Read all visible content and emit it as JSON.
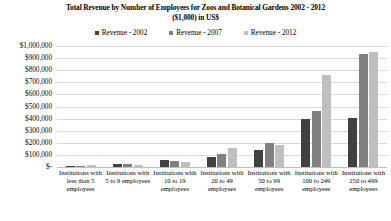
{
  "chart_data": {
    "type": "bar",
    "title": "Total Revenue by Number of Employees for Zoos and Botanical Gardens 2002 - 2012 ($1,000) in US$",
    "title_line1": "Total Revenue by Number of Employees for Zoos and Botanical Gardens 2002 - 2012",
    "title_line2": "($1,000) in US$",
    "xlabel": "",
    "ylabel": "",
    "ylim": [
      0,
      1000000
    ],
    "ytick_step": 100000,
    "grid": true,
    "legend_position": "top-center",
    "categories": [
      "Institutions with less than 5 employees",
      "Institutions with 5 to 9 employees",
      "Institutions with 10 to 19 employees",
      "Institutions with 20 to 49 employees",
      "Institutions with 50 to 99 employees",
      "Institutions with 100 to 249 employees",
      "Institutions with 250 to 499 employees"
    ],
    "ytick_labels": [
      "$1,000,000",
      "$900,000",
      "$800,000",
      "$700,000",
      "$600,000",
      "$500,000",
      "$400,000",
      "$300,000",
      "$200,000",
      "$100,000",
      "$-"
    ],
    "ytick_values": [
      1000000,
      900000,
      800000,
      700000,
      600000,
      500000,
      400000,
      300000,
      200000,
      100000,
      0
    ],
    "series": [
      {
        "name": "Revenue - 2002",
        "color": "#404040",
        "values": [
          9000,
          22000,
          55000,
          80000,
          140000,
          400000,
          405000
        ]
      },
      {
        "name": "Revenue - 2007",
        "color": "#808080",
        "values": [
          11000,
          28000,
          50000,
          110000,
          200000,
          460000,
          930000
        ]
      },
      {
        "name": "Revenue - 2012",
        "color": "#bfbfbf",
        "values": [
          13000,
          14000,
          40000,
          160000,
          185000,
          760000,
          950000
        ]
      }
    ]
  }
}
